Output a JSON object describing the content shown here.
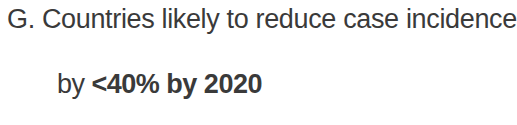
{
  "figure_caption": {
    "panel_label": "G.",
    "lines": [
      "G. Countries likely to reduce case incidence",
      "by <40% by 2020"
    ],
    "line_1": "G. Countries likely to reduce case incidence",
    "line_2_lead": "by ",
    "line_2_emphasis": "<40% by 2020",
    "full_text": "G. Countries likely to reduce case incidence by <40% by 2020",
    "threshold": "<40%",
    "target_year": "2020",
    "text_color": "#3a3a3a",
    "background_color": "#ffffff"
  }
}
